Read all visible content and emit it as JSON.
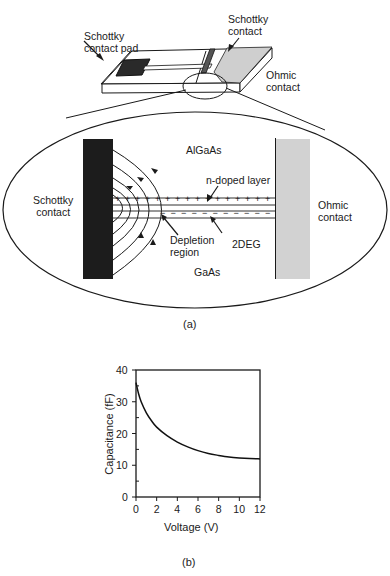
{
  "figure_a": {
    "caption": "(a)",
    "device_labels": {
      "schottky_pad": [
        "Schottky",
        "contact pad"
      ],
      "schottky_contact": [
        "Schottky",
        "contact"
      ],
      "ohmic_contact": [
        "Ohmic",
        "contact"
      ]
    },
    "cross_section": {
      "top_material": "AlGaAs",
      "bottom_material": "GaAs",
      "left_contact": [
        "Schottky",
        "contact"
      ],
      "right_contact": [
        "Ohmic",
        "contact"
      ],
      "n_doped_layer": "n-doped layer",
      "depletion_region": [
        "Depletion",
        "region"
      ],
      "twodeg": "2DEG",
      "plus_sign": "+",
      "minus_sign": "−"
    }
  },
  "figure_b": {
    "caption": "(b)"
  },
  "chart_data": {
    "type": "line",
    "title": "",
    "xlabel": "Voltage (V)",
    "ylabel": "Capacitance (fF)",
    "xlim": [
      0,
      12
    ],
    "ylim": [
      0,
      40
    ],
    "xticks": [
      0,
      2,
      4,
      6,
      8,
      10,
      12
    ],
    "yticks": [
      0,
      10,
      20,
      30,
      40
    ],
    "grid": false,
    "legend": null,
    "series": [
      {
        "name": "Capacitance",
        "x": [
          0,
          0.25,
          0.5,
          1,
          1.5,
          2,
          3,
          4,
          5,
          6,
          7,
          8,
          9,
          10,
          11,
          12
        ],
        "y": [
          36,
          32.5,
          30,
          26.5,
          24,
          22,
          19.3,
          17.3,
          15.8,
          14.6,
          13.7,
          13.1,
          12.6,
          12.3,
          12.1,
          12
        ]
      }
    ]
  },
  "colors": {
    "ink": "#1a1a1a",
    "schottky_metal": "#1c1c1c",
    "ohmic_metal": "#c8c8c8",
    "background": "#ffffff"
  }
}
